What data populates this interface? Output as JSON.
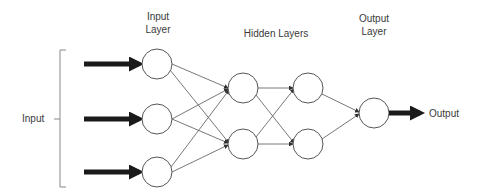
{
  "labels": {
    "input_layer_line1": "Input",
    "input_layer_line2": "Layer",
    "hidden_layers": "Hidden Layers",
    "output_layer_line1": "Output",
    "output_layer_line2": "Layer",
    "input": "Input",
    "output": "Output"
  },
  "network": {
    "layers": [
      {
        "name": "input",
        "nodes": 3
      },
      {
        "name": "hidden-1",
        "nodes": 2
      },
      {
        "name": "hidden-2",
        "nodes": 2
      },
      {
        "name": "output",
        "nodes": 1
      }
    ],
    "connections": "fully-connected"
  },
  "colors": {
    "node_stroke": "#555555",
    "edge": "#555555",
    "arrow": "#1a1a1a",
    "bracket": "#888888",
    "text": "#3a3a3a"
  }
}
